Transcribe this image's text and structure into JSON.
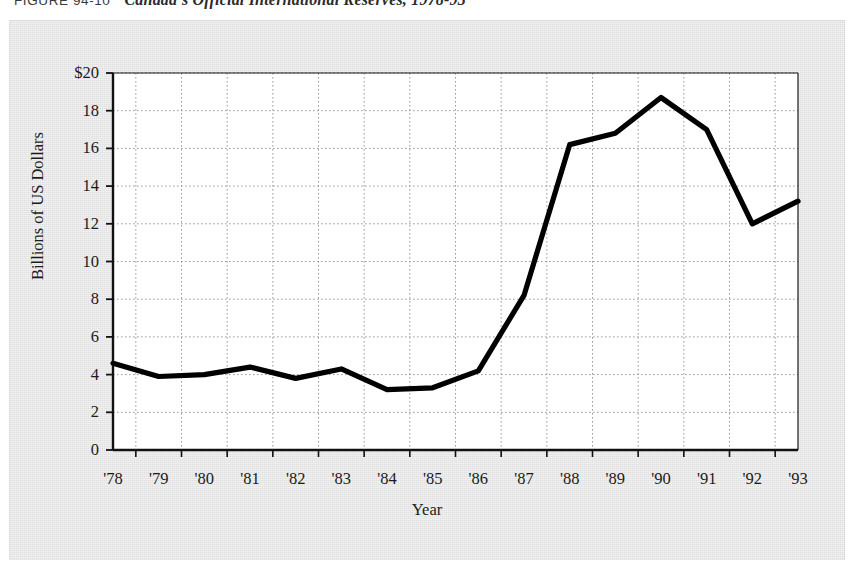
{
  "caption": {
    "figure_label": "FIGURE 94-10",
    "title": "Canada's Official International Reserves, 1978-93"
  },
  "chart_data": {
    "type": "line",
    "title": "Canada's Official International Reserves, 1978-93",
    "xlabel": "Year",
    "ylabel": "Billions of US Dollars",
    "categories": [
      "'78",
      "'79",
      "'80",
      "'81",
      "'82",
      "'83",
      "'84",
      "'85",
      "'86",
      "'87",
      "'88",
      "'89",
      "'90",
      "'91",
      "'92",
      "'93"
    ],
    "values": [
      4.6,
      3.9,
      4.0,
      4.4,
      3.8,
      4.3,
      3.2,
      3.3,
      4.2,
      8.2,
      16.2,
      16.8,
      18.7,
      17.0,
      12.0,
      13.2
    ],
    "ylim": [
      0,
      20
    ],
    "ytick_labels": [
      "0",
      "2",
      "4",
      "6",
      "8",
      "10",
      "12",
      "14",
      "16",
      "18",
      "$20"
    ],
    "ytick_values": [
      0,
      2,
      4,
      6,
      8,
      10,
      12,
      14,
      16,
      18,
      20
    ],
    "grid": "dotted-both",
    "legend": "none",
    "line_color": "#000000",
    "plot_background": "#ffffff",
    "panel_background": "#e7e7e7"
  }
}
